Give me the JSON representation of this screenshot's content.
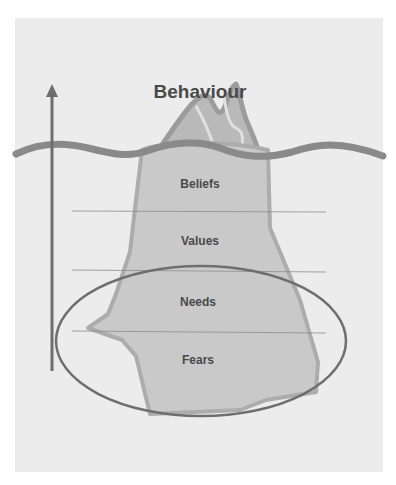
{
  "diagram": {
    "type": "iceberg-model",
    "title": "Behaviour",
    "layers": [
      {
        "label": "Beliefs"
      },
      {
        "label": "Values"
      },
      {
        "label": "Needs"
      },
      {
        "label": "Fears"
      }
    ],
    "highlighted_layers": [
      "Needs",
      "Fears"
    ],
    "arrow_direction": "up",
    "colors": {
      "background": "#ececec",
      "iceberg_fill": "#c9c9c9",
      "iceberg_outline": "#a9a9a9",
      "waterline": "#8a8a8a",
      "ellipse": "#6e6e6e",
      "arrow": "#6e6e6e",
      "text": "#4a4a4a"
    }
  }
}
